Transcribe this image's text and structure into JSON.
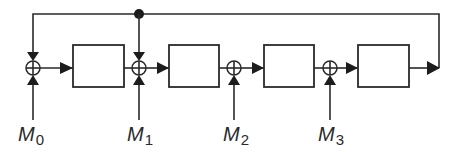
{
  "diagram": {
    "type": "shift-register feedback network",
    "colors": {
      "stroke": "#2a2a2a",
      "background": "#ffffff",
      "arrow": "#1c1c1c"
    },
    "inputs": [
      {
        "base": "M",
        "sub": "0"
      },
      {
        "base": "M",
        "sub": "1"
      },
      {
        "base": "M",
        "sub": "2"
      },
      {
        "base": "M",
        "sub": "3"
      }
    ],
    "blocks": [
      "",
      "",
      "",
      ""
    ],
    "adders": [
      "xor",
      "xor",
      "xor",
      "xor"
    ],
    "feedback": {
      "tap_node": "junction-dot",
      "targets": [
        "adder-0",
        "adder-1"
      ]
    }
  }
}
